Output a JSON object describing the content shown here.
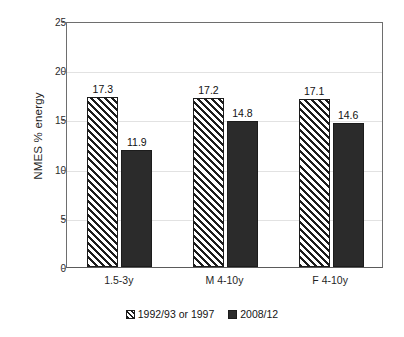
{
  "chart_data": {
    "type": "bar",
    "title": "",
    "xlabel": "",
    "ylabel": "NMES % energy",
    "categories": [
      "1.5-3y",
      "M 4-10y",
      "F 4-10y"
    ],
    "series": [
      {
        "name": "1992/93 or 1997",
        "values": [
          17.3,
          17.2,
          17.1
        ],
        "style": "diagonal-hatch"
      },
      {
        "name": "2008/12",
        "values": [
          11.9,
          14.8,
          14.6
        ],
        "style": "solid-dark"
      }
    ],
    "ylim": [
      0,
      25
    ],
    "yticks": [
      0,
      5,
      10,
      15,
      20,
      25
    ],
    "ytick_labels": [
      "0",
      "5",
      "10",
      "15",
      "20",
      "25"
    ],
    "grid": true,
    "grid_axis": "y",
    "legend_position": "bottom-center",
    "data_labels": true,
    "colors": {
      "series_1_fill": "#ffffff",
      "series_1_hatch": "#1c1c1c",
      "series_2_fill": "#2b2b2b",
      "axis": "#6e6e6e",
      "gridline": "#e2e2e2",
      "text": "#1a1a1a"
    }
  }
}
